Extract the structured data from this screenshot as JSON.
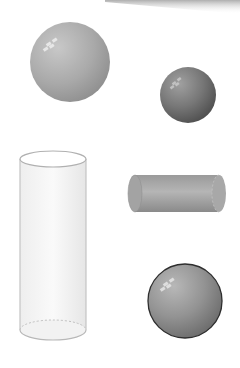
{
  "figure": {
    "shapes": [
      {
        "type": "sphere",
        "label": "large-light-sphere",
        "cx": 70,
        "cy": 62,
        "r": 40,
        "fill": "#a8a8a8"
      },
      {
        "type": "sphere",
        "label": "small-dark-sphere",
        "cx": 188,
        "cy": 95,
        "r": 28,
        "fill": "#7a7a7a"
      },
      {
        "type": "cylinder",
        "orientation": "vertical",
        "label": "transparent-cylinder",
        "x": 20,
        "y_top": 159,
        "width": 66,
        "y_bottom": 330
      },
      {
        "type": "cylinder",
        "orientation": "horizontal",
        "label": "grey-horizontal-cylinder",
        "x_left": 128,
        "x_right": 226,
        "y_top": 175,
        "y_bottom": 212,
        "fill": "#a5a5a5"
      },
      {
        "type": "sphere",
        "label": "outlined-sphere",
        "cx": 185,
        "cy": 301,
        "r": 37,
        "fill": "#8f8f8f"
      }
    ],
    "colors": {
      "background": "#ffffff",
      "sphere_light": "#b4b4b4",
      "sphere_dark": "#6e6e6e",
      "outline": "#333333",
      "cylinder_edge": "#b8b8b8"
    }
  }
}
